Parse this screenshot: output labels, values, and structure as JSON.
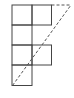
{
  "diagram": {
    "stroke_color": "#444444",
    "dashed_color": "#555555",
    "cells": [
      {
        "row": 1,
        "col": 1,
        "x": 12,
        "y": 5,
        "w": 20,
        "h": 20
      },
      {
        "row": 1,
        "col": 2,
        "x": 32,
        "y": 5,
        "w": 19.5,
        "h": 20
      },
      {
        "row": 2,
        "col": 1,
        "x": 12,
        "y": 25,
        "w": 20,
        "h": 20
      },
      {
        "row": 3,
        "col": 1,
        "x": 12,
        "y": 45,
        "w": 20,
        "h": 20
      },
      {
        "row": 3,
        "col": 2,
        "x": 32,
        "y": 45,
        "w": 19.5,
        "h": 20
      },
      {
        "row": 4,
        "col": 1,
        "x": 12,
        "y": 65,
        "w": 20,
        "h": 20.5
      }
    ],
    "dashed_lines": [
      {
        "name": "diagonal",
        "x1": 12.5,
        "y1": 85.5,
        "x2": 71,
        "y2": 5
      },
      {
        "name": "top-extension",
        "x1": 51.5,
        "y1": 5,
        "x2": 71,
        "y2": 5
      }
    ]
  }
}
